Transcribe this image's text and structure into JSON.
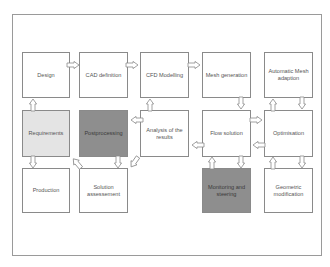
{
  "diagram": {
    "nodes": [
      {
        "id": "design",
        "label": "Design",
        "row": 1,
        "col": 1,
        "shade": "white"
      },
      {
        "id": "cad",
        "label": "CAD definition",
        "row": 1,
        "col": 2,
        "shade": "white"
      },
      {
        "id": "cfd",
        "label": "CFD Modelling",
        "row": 1,
        "col": 3,
        "shade": "white"
      },
      {
        "id": "mesh",
        "label": "Mesh generation",
        "row": 1,
        "col": 4,
        "shade": "white"
      },
      {
        "id": "auto_mesh",
        "label": "Automatic Mesh adaption",
        "row": 1,
        "col": 5,
        "shade": "white"
      },
      {
        "id": "requirements",
        "label": "Requirements",
        "row": 2,
        "col": 1,
        "shade": "light"
      },
      {
        "id": "postprocessing",
        "label": "Postprocessing",
        "row": 2,
        "col": 2,
        "shade": "dark"
      },
      {
        "id": "analysis",
        "label": "Analysis of the results",
        "row": 2,
        "col": 3,
        "shade": "white"
      },
      {
        "id": "flow",
        "label": "Flow solution",
        "row": 2,
        "col": 4,
        "shade": "white"
      },
      {
        "id": "optimisation",
        "label": "Optimisation",
        "row": 2,
        "col": 5,
        "shade": "white"
      },
      {
        "id": "production",
        "label": "Production",
        "row": 3,
        "col": 1,
        "shade": "white"
      },
      {
        "id": "assessment",
        "label": "Solution assessement",
        "row": 3,
        "col": 2,
        "shade": "white"
      },
      {
        "id": "monitoring",
        "label": "Monitoring and steering",
        "row": 3,
        "col": 4,
        "shade": "dark"
      },
      {
        "id": "geometric",
        "label": "Geometric modification",
        "row": 3,
        "col": 5,
        "shade": "white"
      }
    ],
    "edges": [
      {
        "from": "requirements",
        "to": "design"
      },
      {
        "from": "design",
        "to": "cad"
      },
      {
        "from": "cad",
        "to": "cfd"
      },
      {
        "from": "cfd",
        "to": "mesh"
      },
      {
        "from": "mesh",
        "to": "flow"
      },
      {
        "from": "flow",
        "to": "optimisation"
      },
      {
        "from": "optimisation",
        "to": "flow"
      },
      {
        "from": "optimisation",
        "to": "auto_mesh"
      },
      {
        "from": "auto_mesh",
        "to": "optimisation"
      },
      {
        "from": "optimisation",
        "to": "geometric"
      },
      {
        "from": "geometric",
        "to": "optimisation"
      },
      {
        "from": "flow",
        "to": "monitoring"
      },
      {
        "from": "monitoring",
        "to": "flow"
      },
      {
        "from": "flow",
        "to": "analysis"
      },
      {
        "from": "analysis",
        "to": "cfd"
      },
      {
        "from": "analysis",
        "to": "postprocessing"
      },
      {
        "from": "postprocessing",
        "to": "assessment"
      },
      {
        "from": "analysis",
        "to": "assessment"
      },
      {
        "from": "assessment",
        "to": "requirements"
      },
      {
        "from": "requirements",
        "to": "production"
      }
    ],
    "colors": {
      "border": "#8a8a8a",
      "light_fill": "#e4e4e4",
      "dark_fill": "#8e8e8e",
      "white_fill": "#ffffff"
    }
  }
}
